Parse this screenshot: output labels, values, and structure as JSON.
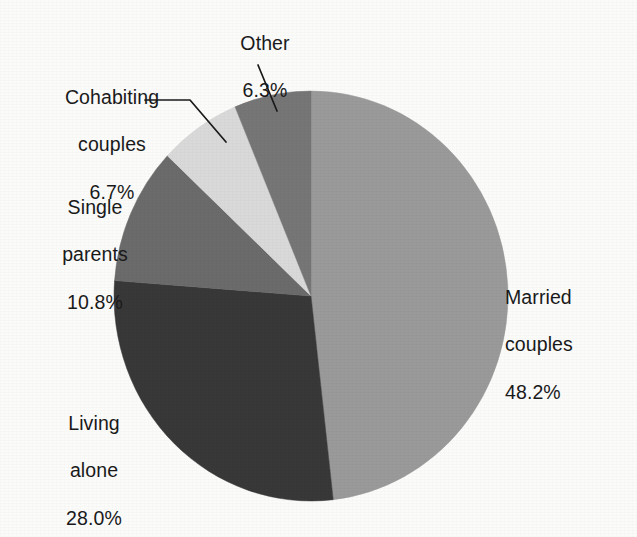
{
  "chart_data": {
    "type": "pie",
    "title": "",
    "subtitle": "",
    "xlabel": "",
    "ylabel": "",
    "legend_position": "none",
    "grid": false,
    "labels_outside": true,
    "start_angle_deg": 0,
    "direction": "clockwise",
    "categories": [
      "Married couples",
      "Living alone",
      "Single parents",
      "Cohabiting couples",
      "Other"
    ],
    "values": [
      48.2,
      28.0,
      10.8,
      6.7,
      6.3
    ],
    "value_unit": "%",
    "colors": [
      "#9a9a9a",
      "#383838",
      "#6b6b6b",
      "#d9d9d9",
      "#767676"
    ],
    "slices": [
      {
        "name": "Married couples",
        "value": 48.2,
        "value_text": "48.2%",
        "label_line1": "Married",
        "label_line2": "couples",
        "color": "#9a9a9a",
        "leader_line": false
      },
      {
        "name": "Living alone",
        "value": 28.0,
        "value_text": "28.0%",
        "label_line1": "Living",
        "label_line2": "alone",
        "color": "#383838",
        "leader_line": false
      },
      {
        "name": "Single parents",
        "value": 10.8,
        "value_text": "10.8%",
        "label_line1": "Single",
        "label_line2": "parents",
        "color": "#6b6b6b",
        "leader_line": false
      },
      {
        "name": "Cohabiting couples",
        "value": 6.7,
        "value_text": "6.7%",
        "label_line1": "Cohabiting",
        "label_line2": "couples",
        "color": "#d9d9d9",
        "leader_line": true
      },
      {
        "name": "Other",
        "value": 6.3,
        "value_text": "6.3%",
        "label_line1": "Other",
        "label_line2": "",
        "color": "#767676",
        "leader_line": true
      }
    ]
  },
  "labels": {
    "other": {
      "name": "Other",
      "value": "6.3%"
    },
    "cohabiting": {
      "name_line1": "Cohabiting",
      "name_line2": "couples",
      "value": "6.7%"
    },
    "single_parents": {
      "name_line1": "Single",
      "name_line2": "parents",
      "value": "10.8%"
    },
    "living_alone": {
      "name_line1": "Living",
      "name_line2": "alone",
      "value": "28.0%"
    },
    "married": {
      "name_line1": "Married",
      "name_line2": "couples",
      "value": "48.2%"
    }
  },
  "colors": {
    "background": "#fbfbfa",
    "text": "#1a1a1a",
    "leader_line": "#1a1a1a",
    "married_couples": "#9a9a9a",
    "living_alone": "#383838",
    "single_parents": "#6b6b6b",
    "cohabiting_couples": "#d9d9d9",
    "other": "#767676"
  }
}
